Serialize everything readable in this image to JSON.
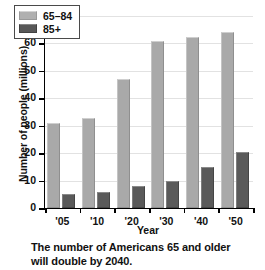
{
  "chart_data": {
    "type": "bar",
    "title": "",
    "xlabel": "Year",
    "ylabel": "Number of people (millions)",
    "categories": [
      "'05",
      "'10",
      "'20",
      "'30",
      "'40",
      "'50"
    ],
    "series": [
      {
        "name": "65–84",
        "values": [
          31,
          33,
          47,
          61,
          62.5,
          64
        ],
        "color": "#a9a9a9"
      },
      {
        "name": "85+",
        "values": [
          5,
          6,
          8,
          10,
          15,
          20.5
        ],
        "color": "#5a5a5a"
      }
    ],
    "ylim": [
      0,
      70
    ],
    "yticks": [
      0,
      10,
      20,
      30,
      40,
      50,
      60,
      70
    ],
    "ytick_labels": [
      "0",
      "10",
      "20",
      "30",
      "40",
      "50",
      "60",
      "70"
    ],
    "grid": true,
    "legend_position": "top-left",
    "caption": "The number of Americans 65 and older will double by 2040."
  }
}
